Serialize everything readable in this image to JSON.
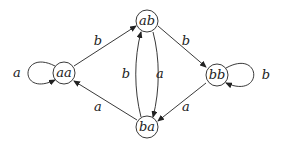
{
  "diagram": {
    "type": "state-transition-graph",
    "nodes": [
      {
        "id": "aa",
        "label": "aa"
      },
      {
        "id": "ab",
        "label": "ab"
      },
      {
        "id": "ba",
        "label": "ba"
      },
      {
        "id": "bb",
        "label": "bb"
      }
    ],
    "edges": [
      {
        "from": "aa",
        "to": "aa",
        "label": "a"
      },
      {
        "from": "aa",
        "to": "ab",
        "label": "b"
      },
      {
        "from": "ba",
        "to": "aa",
        "label": "a"
      },
      {
        "from": "ba",
        "to": "ab",
        "label": "b"
      },
      {
        "from": "ab",
        "to": "ba",
        "label": "a"
      },
      {
        "from": "ab",
        "to": "bb",
        "label": "b"
      },
      {
        "from": "bb",
        "to": "ba",
        "label": "a"
      },
      {
        "from": "bb",
        "to": "bb",
        "label": "b"
      }
    ]
  }
}
